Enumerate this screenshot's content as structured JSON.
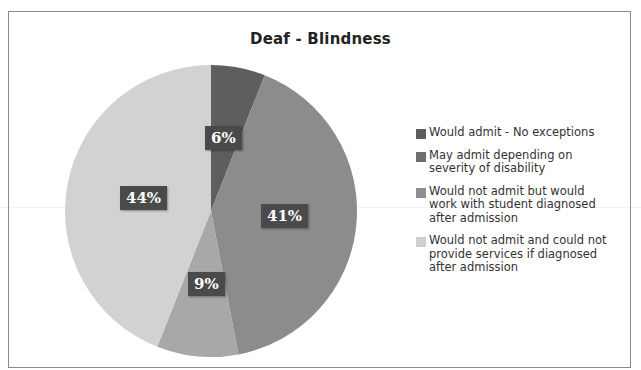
{
  "chart_data": {
    "type": "pie",
    "title": "Deaf - Blindness",
    "categories": [
      "Would admit - No exceptions",
      "May admit depending on severity of disability",
      "Would not admit but would work with student diagnosed after admission",
      "Would not admit and could not provide services if diagnosed after admission"
    ],
    "values": [
      6,
      41,
      9,
      44
    ],
    "labels": [
      "6%",
      "41%",
      "9%",
      "44%"
    ],
    "colors": [
      "#5e5e5e",
      "#8c8c8c",
      "#a8a8a8",
      "#d2d2d2"
    ],
    "legend_position": "right",
    "start_angle": "12 o'clock, clockwise"
  },
  "title": "Deaf - Blindness",
  "slice_labels": {
    "s0": "6%",
    "s1": "41%",
    "s2": "9%",
    "s3": "44%"
  },
  "legend": {
    "items": [
      {
        "label": "Would admit - No exceptions",
        "color": "#5e5e5e"
      },
      {
        "label": "May admit depending on severity of disability",
        "color": "#6e6e6e"
      },
      {
        "label": "Would not admit but would work with student diagnosed after admission",
        "color": "#909090"
      },
      {
        "label": "Would not admit and could not provide services if diagnosed after admission",
        "color": "#cfcfcf"
      }
    ]
  }
}
